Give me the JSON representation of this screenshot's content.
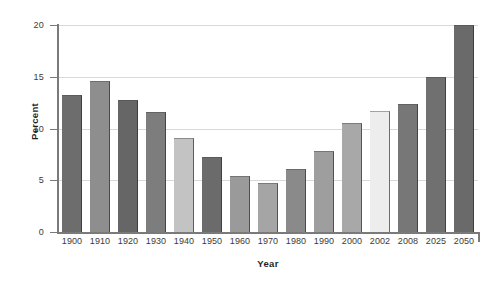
{
  "chart_data": {
    "type": "bar",
    "title": "",
    "xlabel": "Year",
    "ylabel": "Percent",
    "categories": [
      "1900",
      "1910",
      "1920",
      "1930",
      "1940",
      "1950",
      "1960",
      "1970",
      "1980",
      "1990",
      "2000",
      "2002",
      "2008",
      "2025",
      "2050"
    ],
    "values": [
      13.2,
      14.6,
      12.8,
      11.6,
      9.1,
      7.2,
      5.4,
      4.7,
      6.1,
      7.8,
      10.5,
      11.7,
      12.4,
      15.0,
      20.0
    ],
    "ylim": [
      0,
      20
    ],
    "yticks": [
      0,
      5,
      10,
      15,
      20
    ],
    "ytick_labels": [
      "0",
      "5",
      "10",
      "15",
      "20"
    ],
    "grid": true,
    "grid_axis": "y",
    "legend": "none",
    "bar_colors": [
      "#6d6d6d",
      "#8e8e8e",
      "#666666",
      "#7d7d7d",
      "#c3c3c3",
      "#6b6b6b",
      "#9a9a9a",
      "#a5a5a5",
      "#8a8a8a",
      "#9e9e9e",
      "#a8a8a8",
      "#ededed",
      "#777777",
      "#707070",
      "#6a6a6a"
    ]
  },
  "axes": {
    "y_title": "Percent",
    "x_title": "Year"
  }
}
